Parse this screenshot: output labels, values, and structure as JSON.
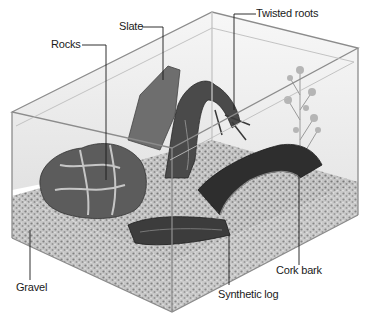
{
  "diagram": {
    "labels": [
      {
        "id": "rocks",
        "text": "Rocks"
      },
      {
        "id": "slate",
        "text": "Slate"
      },
      {
        "id": "twisted_roots",
        "text": "Twisted roots"
      },
      {
        "id": "gravel",
        "text": "Gravel"
      },
      {
        "id": "synthetic_log",
        "text": "Synthetic log"
      },
      {
        "id": "cork_bark",
        "text": "Cork bark"
      }
    ],
    "colors": {
      "glass_edge": "#9a9a9a",
      "gravel": "#b8b8b8",
      "background": "#ffffff",
      "text": "#1a1a1a"
    }
  }
}
